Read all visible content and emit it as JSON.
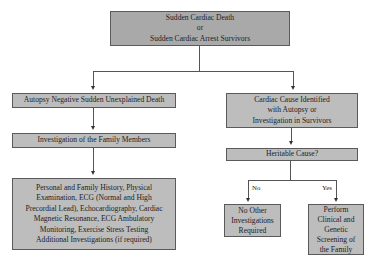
{
  "diagram": {
    "root": {
      "lines": [
        "Sudden Cardiac Death",
        "or",
        "Sudden Cardiac Arrest Survivors"
      ]
    },
    "left_branch": {
      "step1": "Autopsy Negative Sudden Unexplained Death",
      "step2": "Investigation of the Family Members",
      "step3_lines": [
        "Personal and Family History, Physical",
        "Examination, ECG (Normal and High",
        "Precordial Lead), Echocardiography, Cardiac",
        "Magnetic Resonance, ECG Ambulatory",
        "Monitoring, Exercise Stress Testing",
        "Additional Investigations (if required)"
      ]
    },
    "right_branch": {
      "step1_lines": [
        "Cardiac Cause Identified",
        "with Autopsy or",
        "Investigation in Survivors"
      ],
      "decision": "Heritable Cause?",
      "no_label": "No",
      "yes_label": "Yes",
      "no_outcome_lines": [
        "No Other",
        "Investigations",
        "Required"
      ],
      "yes_outcome_lines": [
        "Perform",
        "Clinical and",
        "Genetic",
        "Screening of",
        "the Family"
      ]
    }
  },
  "colors": {
    "root_fill": "#a9a9a9",
    "box_fill": "#bdbdbd",
    "border": "#5a5a5a",
    "connector": "#555555"
  }
}
